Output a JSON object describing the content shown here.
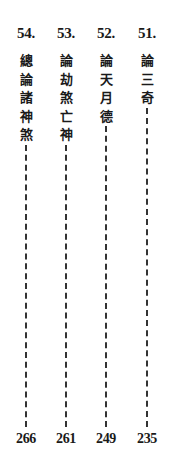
{
  "toc": {
    "reading_direction": "right-to-left, vertical",
    "entries": [
      {
        "number": "51.",
        "title": "論三奇",
        "chars": [
          "論",
          "三",
          "奇"
        ],
        "page": "235"
      },
      {
        "number": "52.",
        "title": "論天月德",
        "chars": [
          "論",
          "天",
          "月",
          "德"
        ],
        "page": "249"
      },
      {
        "number": "53.",
        "title": "論劫煞亡神",
        "chars": [
          "論",
          "劫",
          "煞",
          "亡",
          "神"
        ],
        "page": "261"
      },
      {
        "number": "54.",
        "title": "總論諸神煞",
        "chars": [
          "總",
          "論",
          "諸",
          "神",
          "煞"
        ],
        "page": "266"
      }
    ]
  },
  "colors": {
    "background": "#ffffff",
    "text": "#1a1a1a",
    "leader": "#333333"
  }
}
